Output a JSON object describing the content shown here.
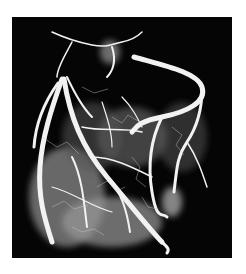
{
  "image": {
    "subject": "coronary angiogram of heart vessels",
    "background_color": "#ffffff",
    "panel_color": "#050505",
    "vessel_color": "#f2f2f2"
  }
}
